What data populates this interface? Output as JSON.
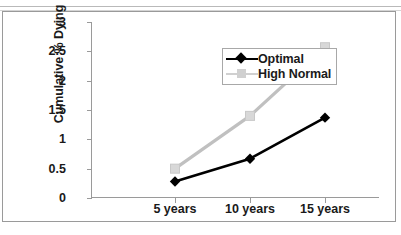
{
  "chart_data": {
    "type": "line",
    "title": "",
    "xlabel": "",
    "ylabel": "Cumulative % Dying",
    "categories": [
      "5 years",
      "10 years",
      "15 years"
    ],
    "ylim": [
      0,
      3
    ],
    "yticks": [
      "0",
      "0.5",
      "1",
      "1.5",
      "2",
      "2.5",
      "3"
    ],
    "grid": false,
    "legend_position": "upper-left-inside",
    "series": [
      {
        "name": "Optimal",
        "values": [
          0.28,
          0.67,
          1.37
        ],
        "color": "#000000",
        "marker": "diamond"
      },
      {
        "name": "High Normal",
        "values": [
          0.5,
          1.4,
          2.57
        ],
        "color": "#c0c0c0",
        "marker": "square"
      }
    ]
  },
  "legend": {
    "items": [
      {
        "label": "Optimal"
      },
      {
        "label": "High Normal"
      }
    ]
  }
}
